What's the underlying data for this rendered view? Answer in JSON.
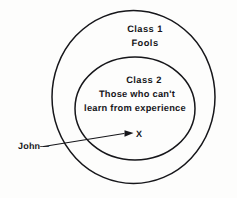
{
  "diagram": {
    "type": "venn-nested-ellipses",
    "background_color": "#fdfdfc",
    "stroke_color": "#16161a",
    "outer_set": {
      "title": "Class 1",
      "subtitle": "Fools"
    },
    "inner_set": {
      "title": "Class 2",
      "description_line_1": "Those who can't",
      "description_line_2": "learn from experience"
    },
    "annotation": {
      "label": "John",
      "marker": "X",
      "dash": "—"
    }
  }
}
